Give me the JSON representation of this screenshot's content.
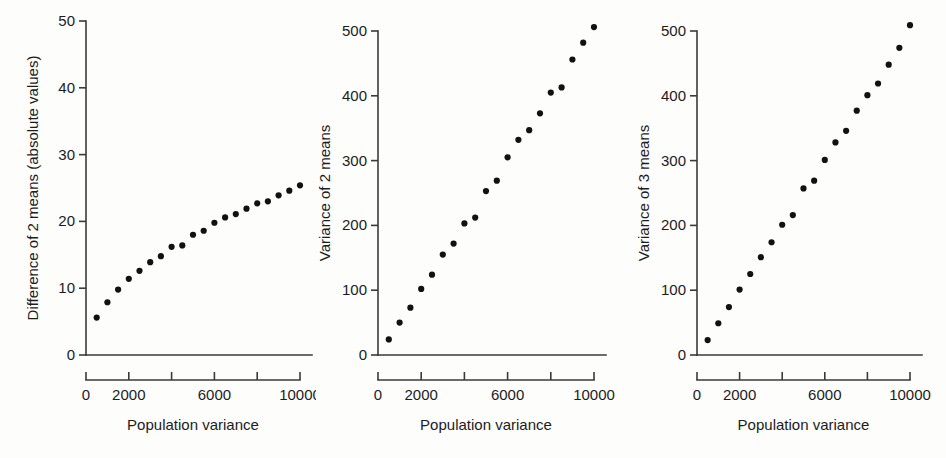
{
  "figure": {
    "background_color": "#fdfdfc",
    "point_color": "#111111",
    "axis_color": "#3a3a3a"
  },
  "chart_data": [
    {
      "type": "scatter",
      "title": "",
      "xlabel": "Population variance",
      "ylabel": "Difference of 2 means (absolute values)",
      "xlim": [
        0,
        10000
      ],
      "ylim": [
        0,
        50
      ],
      "grid": false,
      "legend": false,
      "xticks": [
        0,
        2000,
        4000,
        6000,
        8000,
        10000
      ],
      "xticklabels": [
        "0",
        "2000",
        "",
        "6000",
        "",
        "10000"
      ],
      "yticks": [
        0,
        10,
        20,
        30,
        40,
        50
      ],
      "yticklabels": [
        "0",
        "10",
        "20",
        "30",
        "40",
        "50"
      ],
      "x": [
        500,
        1000,
        1500,
        2000,
        2500,
        3000,
        3500,
        4000,
        4500,
        5000,
        5500,
        6000,
        6500,
        7000,
        7500,
        8000,
        8500,
        9000,
        9500,
        10000
      ],
      "y": [
        5.6,
        7.9,
        9.8,
        11.4,
        12.6,
        13.9,
        14.8,
        16.2,
        16.4,
        18.0,
        18.6,
        19.8,
        20.6,
        21.1,
        21.9,
        22.7,
        23.0,
        23.9,
        24.6,
        25.4
      ]
    },
    {
      "type": "scatter",
      "title": "",
      "xlabel": "Population variance",
      "ylabel": "Variance of 2 means",
      "xlim": [
        0,
        10000
      ],
      "ylim": [
        0,
        500
      ],
      "grid": false,
      "legend": false,
      "xticks": [
        0,
        2000,
        4000,
        6000,
        8000,
        10000
      ],
      "xticklabels": [
        "0",
        "2000",
        "",
        "6000",
        "",
        "10000"
      ],
      "yticks": [
        0,
        100,
        200,
        300,
        400,
        500
      ],
      "yticklabels": [
        "0",
        "100",
        "200",
        "300",
        "400",
        "500"
      ],
      "x": [
        500,
        1000,
        1500,
        2000,
        2500,
        3000,
        3500,
        4000,
        4500,
        5000,
        5500,
        6000,
        6500,
        7000,
        7500,
        8000,
        8500,
        9000,
        9500,
        10000
      ],
      "y": [
        24,
        50,
        73,
        102,
        124,
        155,
        172,
        203,
        212,
        253,
        269,
        305,
        332,
        347,
        373,
        405,
        413,
        456,
        482,
        506
      ]
    },
    {
      "type": "scatter",
      "title": "",
      "xlabel": "Population variance",
      "ylabel": "Variance of 3 means",
      "xlim": [
        0,
        10000
      ],
      "ylim": [
        0,
        500
      ],
      "grid": false,
      "legend": false,
      "xticks": [
        0,
        2000,
        4000,
        6000,
        8000,
        10000
      ],
      "xticklabels": [
        "0",
        "2000",
        "",
        "6000",
        "",
        "10000"
      ],
      "yticks": [
        0,
        100,
        200,
        300,
        400,
        500
      ],
      "yticklabels": [
        "0",
        "100",
        "200",
        "300",
        "400",
        "500"
      ],
      "x": [
        500,
        1000,
        1500,
        2000,
        2500,
        3000,
        3500,
        4000,
        4500,
        5000,
        5500,
        6000,
        6500,
        7000,
        7500,
        8000,
        8500,
        9000,
        9500,
        10000
      ],
      "y": [
        23,
        49,
        74,
        101,
        125,
        151,
        174,
        201,
        216,
        257,
        269,
        301,
        328,
        346,
        377,
        401,
        419,
        448,
        474,
        509
      ]
    }
  ]
}
